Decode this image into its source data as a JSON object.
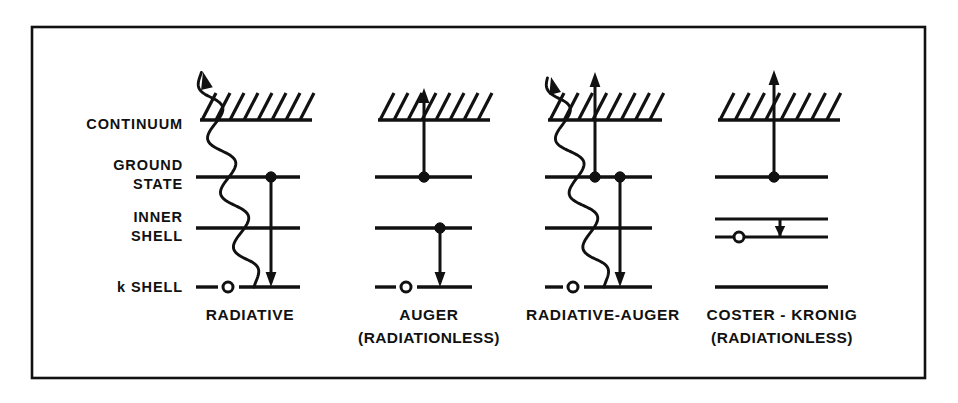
{
  "figure": {
    "frame": {
      "x": 32,
      "y": 27,
      "width": 893,
      "height": 351,
      "color": "#111111"
    },
    "ink_color": "#111111",
    "background_color": "#ffffff"
  },
  "axis_labels": [
    {
      "id": "continuum",
      "lines": [
        "CONTINUUM"
      ],
      "x": 183,
      "y": [
        129
      ]
    },
    {
      "id": "ground-state",
      "lines": [
        "GROUND",
        "STATE"
      ],
      "x": 183,
      "y": [
        170,
        189
      ]
    },
    {
      "id": "inner-shell",
      "lines": [
        "INNER",
        "SHELL"
      ],
      "x": 183,
      "y": [
        222,
        241
      ]
    },
    {
      "id": "k-shell",
      "lines": [
        "k SHELL"
      ],
      "x": 183,
      "y": [
        292
      ]
    }
  ],
  "levels": {
    "continuum_band_y": 120,
    "ground_state_y": 177,
    "inner_shell_y": 228,
    "inner_shell_upper_y": 219,
    "inner_shell_lower_y": 237,
    "k_shell_y": 287
  },
  "hatching": {
    "stroke_count": 8,
    "stroke_spacing": 15,
    "stroke_dx": 14,
    "stroke_dy": -27,
    "description": "slanted hatch marks rising to the right above a baseline"
  },
  "columns": [
    {
      "id": "radiative",
      "caption": "RADIATIVE",
      "subcaption": "",
      "caption_x": 250,
      "caption_y": 320,
      "subcaption_y": 343,
      "level_x1": 196,
      "level_x2": 300,
      "band_x1": 200,
      "band_x2": 312,
      "axis_x": 271,
      "hole_x": 228,
      "k_gap_x1": 218,
      "k_gap_x2": 239,
      "electrons": [
        {
          "level": "ground_state",
          "x": 271
        }
      ],
      "holes": [
        {
          "level": "k_shell",
          "x": 228
        }
      ],
      "transitions": [
        {
          "kind": "down-arrow",
          "name": "electron-transition-ground-to-k",
          "x": 271,
          "y_from": 177,
          "y_to": 287
        }
      ],
      "photon": {
        "present": true,
        "name": "emitted-photon-wavy",
        "kind": "wavy-arrow",
        "start": [
          254,
          287
        ],
        "end": [
          203,
          72
        ],
        "arrow_angle_deg": -115,
        "amplitude": 11,
        "wavelength": 56
      },
      "continuum_arrow": {
        "present": false
      }
    },
    {
      "id": "auger",
      "caption": "AUGER",
      "subcaption": "(RADIATIONLESS)",
      "caption_x": 429,
      "caption_y": 320,
      "subcaption_y": 343,
      "level_x1": 375,
      "level_x2": 472,
      "band_x1": 378,
      "band_x2": 490,
      "axis_x": 424,
      "hole_x": 406,
      "k_gap_x1": 396,
      "k_gap_x2": 417,
      "electrons": [
        {
          "level": "ground_state",
          "x": 424
        },
        {
          "level": "inner_shell",
          "x": 440
        }
      ],
      "holes": [
        {
          "level": "k_shell",
          "x": 406
        }
      ],
      "transitions": [
        {
          "kind": "down-arrow",
          "name": "electron-transition-inner-to-k",
          "x": 440,
          "y_from": 228,
          "y_to": 287
        }
      ],
      "photon": {
        "present": false
      },
      "continuum_arrow": {
        "present": true,
        "name": "ejected-auger-electron-arrow",
        "x": 424,
        "y_from": 177,
        "y_to": 88
      }
    },
    {
      "id": "radiative-auger",
      "caption": "RADIATIVE-AUGER",
      "subcaption": "",
      "caption_x": 603,
      "caption_y": 320,
      "subcaption_y": 343,
      "level_x1": 545,
      "level_x2": 652,
      "band_x1": 548,
      "band_x2": 662,
      "axis_x": 595,
      "hole_x": 573,
      "k_gap_x1": 563,
      "k_gap_x2": 584,
      "electrons": [
        {
          "level": "ground_state",
          "x": 595
        },
        {
          "level": "ground_state",
          "x": 620
        }
      ],
      "holes": [
        {
          "level": "k_shell",
          "x": 573
        }
      ],
      "transitions": [
        {
          "kind": "down-arrow",
          "name": "electron-transition-ground-to-k",
          "x": 620,
          "y_from": 177,
          "y_to": 287
        }
      ],
      "photon": {
        "present": true,
        "name": "emitted-photon-wavy",
        "kind": "wavy-arrow",
        "start": [
          604,
          287
        ],
        "end": [
          551,
          77
        ],
        "arrow_angle_deg": -115,
        "amplitude": 11,
        "wavelength": 56
      },
      "continuum_arrow": {
        "present": true,
        "name": "ejected-auger-electron-arrow",
        "x": 595,
        "y_from": 177,
        "y_to": 72
      }
    },
    {
      "id": "coster-kronig",
      "caption": "COSTER - KRONIG",
      "subcaption": "(RADIATIONLESS)",
      "caption_x": 782,
      "caption_y": 320,
      "subcaption_y": 343,
      "level_x1": 715,
      "level_x2": 828,
      "band_x1": 718,
      "band_x2": 840,
      "axis_x": 774,
      "hole_x": 739,
      "k_gap_x1": 0,
      "k_gap_x2": 0,
      "split_inner_shell": true,
      "electrons": [
        {
          "level": "ground_state",
          "x": 774
        }
      ],
      "holes": [
        {
          "level": "inner_shell_lower",
          "x": 739
        }
      ],
      "transitions": [
        {
          "kind": "down-arrow-short",
          "name": "coster-kronig-transition",
          "x": 780,
          "y_from": 219,
          "y_to": 237
        }
      ],
      "photon": {
        "present": false
      },
      "continuum_arrow": {
        "present": true,
        "name": "ejected-coster-kronig-electron-arrow",
        "x": 774,
        "y_from": 177,
        "y_to": 70
      }
    }
  ]
}
